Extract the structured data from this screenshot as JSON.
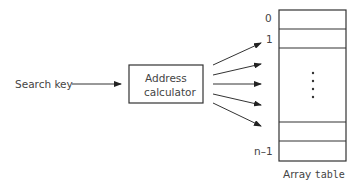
{
  "diagram": {
    "input_label": "Search key",
    "calculator": {
      "line1": "Address",
      "line2": "calculator"
    },
    "array": {
      "index_labels": [
        "0",
        "1",
        "n–1"
      ],
      "ellipsis": "⋮",
      "caption_prefix": "Array ",
      "caption_name": "table"
    },
    "arrow_count": 5,
    "colors": {
      "stroke": "#333333",
      "text": "#444444",
      "background": "#ffffff"
    }
  }
}
